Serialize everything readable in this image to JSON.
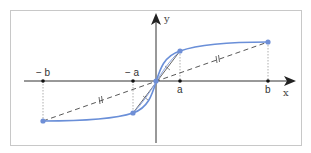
{
  "diagram": {
    "title": "",
    "colors": {
      "frame": "#c8c8c8",
      "axis": "#333333",
      "curve": "#6a8fd8",
      "point": "#6f8fd6",
      "dashed": "#444444",
      "guide": "#999999",
      "chord": "#555555"
    },
    "axes": {
      "x_label": "x",
      "y_label": "y"
    },
    "tick_labels": {
      "neg_b": "− b",
      "neg_a": "− a",
      "a": "a",
      "b": "b"
    },
    "points": [
      {
        "name": "(-b, f(-b))"
      },
      {
        "name": "(-a, f(-a))"
      },
      {
        "name": "origin"
      },
      {
        "name": "(a, f(a))"
      },
      {
        "name": "(b, f(b))"
      }
    ],
    "annotations": {
      "outer_tick_mark": "||",
      "inner_tick_mark": "|"
    }
  }
}
